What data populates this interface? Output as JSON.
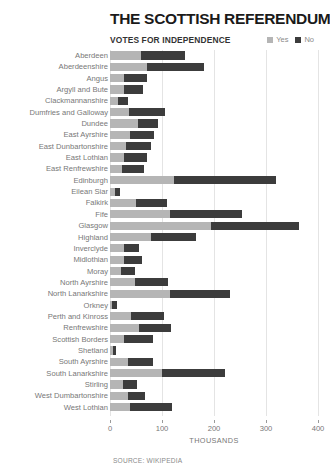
{
  "header": {
    "title": "THE SCOTTISH REFERENDUM",
    "subtitle": "VOTES FOR INDEPENDENCE",
    "legend": [
      {
        "label": "Yes",
        "color": "#b5b5b5"
      },
      {
        "label": "No",
        "color": "#3c3c3c"
      }
    ]
  },
  "footer": {
    "source": "SOURCE: WIKIPEDIA"
  },
  "colors": {
    "yes": "#b5b5b5",
    "no": "#3c3c3c",
    "gridline": "#e4e4e4",
    "text": "#777777",
    "title": "#1a1a1a"
  },
  "chart_data": {
    "type": "bar",
    "orientation": "horizontal",
    "stacked": true,
    "title": "THE SCOTTISH REFERENDUM",
    "subtitle": "VOTES FOR INDEPENDENCE",
    "xlabel": "THOUSANDS",
    "ylabel": "",
    "xlim": [
      0,
      400
    ],
    "xticks": [
      0,
      100,
      200,
      300,
      400
    ],
    "xticklabels": [
      "0",
      "100",
      "200",
      "300",
      "400"
    ],
    "units": "thousands of votes",
    "grid": "vertical",
    "legend_position": "top-right",
    "legend": [
      "Yes",
      "No"
    ],
    "categories": [
      "Aberdeen",
      "Aberdeenshire",
      "Angus",
      "Argyll and Bute",
      "Clackmannanshire",
      "Dumfries and Galloway",
      "Dundee",
      "East Ayrshire",
      "East Dunbartonshire",
      "East Lothian",
      "East Renfrewshire",
      "Edinburgh",
      "Eilean Siar",
      "Falkirk",
      "Fife",
      "Glasgow",
      "Highland",
      "Inverclyde",
      "Midlothian",
      "Moray",
      "North Ayrshire",
      "North Lanarkshire",
      "Orkney",
      "Perth and Kinross",
      "Renfrewshire",
      "Scottish Borders",
      "Shetland",
      "South Ayrshire",
      "South Lanarkshire",
      "Stirling",
      "West Dumbartonshire",
      "West Lothian"
    ],
    "series": [
      {
        "name": "Yes",
        "color": "#b5b5b5",
        "values": [
          59,
          71,
          26,
          27,
          16,
          36,
          53,
          39,
          30,
          27,
          24,
          124,
          10,
          50,
          115,
          195,
          78,
          27,
          27,
          21,
          48,
          115,
          4,
          41,
          55,
          27,
          5,
          34,
          100,
          25,
          34,
          38
        ]
      },
      {
        "name": "No",
        "color": "#3c3c3c",
        "values": [
          85,
          109,
          45,
          37,
          19,
          70,
          40,
          45,
          49,
          44,
          41,
          195,
          9,
          59,
          139,
          169,
          88,
          28,
          34,
          28,
          63,
          116,
          10,
          62,
          62,
          55,
          6,
          48,
          122,
          26,
          34,
          82
        ]
      }
    ]
  }
}
